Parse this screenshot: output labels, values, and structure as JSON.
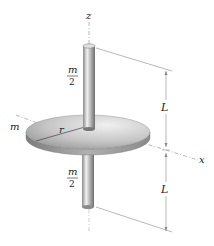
{
  "figure": {
    "labels": {
      "z_axis": "z",
      "x_axis": "x",
      "disk_mass": "m",
      "radius": "r",
      "upper_rod_mass_num": "m",
      "upper_rod_mass_den": "2",
      "lower_rod_mass_num": "m",
      "lower_rod_mass_den": "2",
      "upper_length": "L",
      "lower_length": "L"
    },
    "colors": {
      "line": "#888888",
      "text": "#222222",
      "disk_light": "#e4e4e4",
      "disk_dark": "#8a8a8a",
      "rod_light": "#eeeeee",
      "rod_dark": "#7a7a7a"
    }
  }
}
